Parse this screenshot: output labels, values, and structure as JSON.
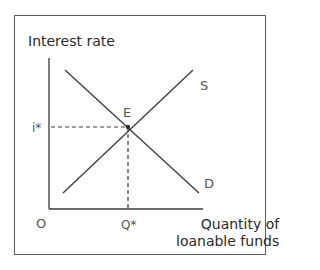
{
  "diagram": {
    "type": "supply-demand",
    "y_axis_label": "Interest rate",
    "x_axis_label_line1": "Quantity of",
    "x_axis_label_line2": "loanable funds",
    "origin_label": "O",
    "equilibrium_label": "E",
    "equilibrium_price_label": "i*",
    "equilibrium_quantity_label": "Q*",
    "supply_label": "S",
    "demand_label": "D",
    "colors": {
      "lines": "#3a3a3a",
      "frame": "#5a5a5a",
      "background": "#ffffff"
    }
  }
}
